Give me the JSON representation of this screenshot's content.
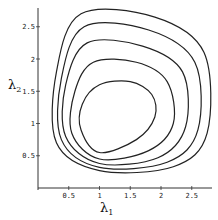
{
  "chart_data": {
    "type": "line",
    "subtype": "contour",
    "title": "",
    "xlabel": "λ1",
    "ylabel": "λ2",
    "xlim": [
      0,
      2.8
    ],
    "ylim": [
      0,
      2.8
    ],
    "x_ticks": [
      "0.5",
      "1",
      "1.5",
      "2",
      "2.5"
    ],
    "y_ticks": [
      "0.5",
      "1",
      "1.5",
      "2",
      "2.5"
    ],
    "grid": false,
    "legend": null,
    "series": [
      {
        "name": "contour-1",
        "points": [
          [
            1.0,
            0.55
          ],
          [
            1.6,
            0.75
          ],
          [
            1.9,
            1.1
          ],
          [
            1.85,
            1.45
          ],
          [
            1.5,
            1.65
          ],
          [
            1.0,
            1.6
          ],
          [
            0.72,
            1.3
          ],
          [
            0.7,
            0.9
          ],
          [
            1.0,
            0.55
          ]
        ]
      },
      {
        "name": "contour-2",
        "points": [
          [
            1.0,
            0.45
          ],
          [
            1.8,
            0.58
          ],
          [
            2.2,
            1.0
          ],
          [
            2.1,
            1.65
          ],
          [
            1.6,
            1.95
          ],
          [
            0.9,
            1.95
          ],
          [
            0.6,
            1.5
          ],
          [
            0.55,
            0.85
          ],
          [
            1.0,
            0.45
          ]
        ]
      },
      {
        "name": "contour-3",
        "points": [
          [
            1.0,
            0.38
          ],
          [
            1.95,
            0.47
          ],
          [
            2.4,
            0.95
          ],
          [
            2.35,
            1.8
          ],
          [
            1.7,
            2.2
          ],
          [
            0.8,
            2.25
          ],
          [
            0.45,
            1.6
          ],
          [
            0.45,
            0.8
          ],
          [
            1.0,
            0.38
          ]
        ]
      },
      {
        "name": "contour-4",
        "points": [
          [
            1.0,
            0.32
          ],
          [
            2.1,
            0.4
          ],
          [
            2.6,
            0.9
          ],
          [
            2.55,
            1.95
          ],
          [
            1.8,
            2.45
          ],
          [
            0.75,
            2.5
          ],
          [
            0.38,
            1.7
          ],
          [
            0.38,
            0.75
          ],
          [
            1.0,
            0.32
          ]
        ]
      },
      {
        "name": "contour-5",
        "points": [
          [
            1.0,
            0.27
          ],
          [
            2.2,
            0.33
          ],
          [
            2.75,
            0.85
          ],
          [
            2.7,
            2.1
          ],
          [
            1.9,
            2.65
          ],
          [
            0.7,
            2.7
          ],
          [
            0.3,
            1.8
          ],
          [
            0.3,
            0.7
          ],
          [
            1.0,
            0.27
          ]
        ]
      }
    ]
  },
  "axes": {
    "x_label_main": "λ",
    "x_label_sub": "1",
    "y_label_main": "λ",
    "y_label_sub": "2"
  }
}
